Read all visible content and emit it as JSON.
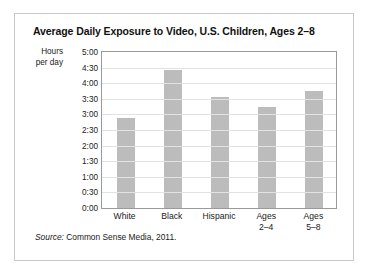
{
  "figure": {
    "title": "Average Daily Exposure to Video, U.S. Children, Ages 2–8",
    "source_word": "Source:",
    "source_text": " Common Sense Media, 2011.",
    "axis_label_line1": "Hours",
    "axis_label_line2": "per day",
    "bar_color": "#bcbcbc",
    "grid_color": "#e2e2e2",
    "frame_color": "#9a9a9a",
    "box_border_color": "#c8c8c8"
  },
  "chart_data": {
    "type": "bar",
    "title": "Average Daily Exposure to Video, U.S. Children, Ages 2–8",
    "xlabel": "",
    "ylabel": "Hours per day",
    "categories": [
      "White",
      "Black",
      "Hispanic",
      "Ages\n2–4",
      "Ages\n5–8"
    ],
    "category_labels": [
      "White",
      "Black",
      "Hispanic",
      "Ages 2–4",
      "Ages 5–8"
    ],
    "values": [
      2.87,
      4.43,
      3.57,
      3.23,
      3.75
    ],
    "value_labels": [
      "2:52",
      "4:26",
      "3:34",
      "3:14",
      "3:45"
    ],
    "ylim": [
      0,
      5
    ],
    "ytick_values": [
      0,
      0.5,
      1,
      1.5,
      2,
      2.5,
      3,
      3.5,
      4,
      4.5,
      5
    ],
    "ytick_labels": [
      "0:00",
      "0:30",
      "1:00",
      "1:30",
      "2:00",
      "2:30",
      "3:00",
      "3:30",
      "4:00",
      "4:30",
      "5:00"
    ],
    "grid": true,
    "legend": false,
    "series": [
      {
        "name": "Average daily video exposure",
        "values": [
          2.87,
          4.43,
          3.57,
          3.23,
          3.75
        ]
      }
    ],
    "source": "Source: Common Sense Media, 2011."
  }
}
